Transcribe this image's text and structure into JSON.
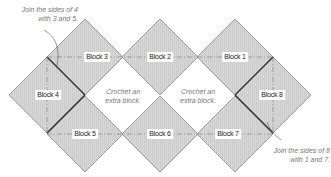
{
  "diagram": {
    "type": "crochet-block-joining-layout",
    "colors": {
      "block_fill": "#d4d4d4",
      "block_edge": "#888888",
      "joined_edge": "#333333",
      "guide_line": "#777777",
      "note_text": "#777777"
    },
    "blocks": [
      {
        "id": 1,
        "label": "Block 1",
        "cx": 235,
        "cy": 57
      },
      {
        "id": 2,
        "label": "Block 2",
        "cx": 160,
        "cy": 57
      },
      {
        "id": 3,
        "label": "Block 3",
        "cx": 85,
        "cy": 57
      },
      {
        "id": 4,
        "label": "Block 4",
        "cx": 47,
        "cy": 95
      },
      {
        "id": 5,
        "label": "Block 5",
        "cx": 85,
        "cy": 134
      },
      {
        "id": 6,
        "label": "Block 6",
        "cx": 160,
        "cy": 134
      },
      {
        "id": 7,
        "label": "Block 7",
        "cx": 235,
        "cy": 134
      },
      {
        "id": 8,
        "label": "Block 8",
        "cx": 273,
        "cy": 95
      }
    ],
    "extra_blocks": [
      {
        "line1": "Crochet an",
        "line2": "extra block."
      },
      {
        "line1": "Crochet an",
        "line2": "extra block."
      }
    ],
    "notes": [
      {
        "line1": "Join the sides of 4",
        "line2": "with 3 and 5."
      },
      {
        "line1": "Join the sides of 8",
        "line2": "with 1 and 7."
      }
    ]
  }
}
